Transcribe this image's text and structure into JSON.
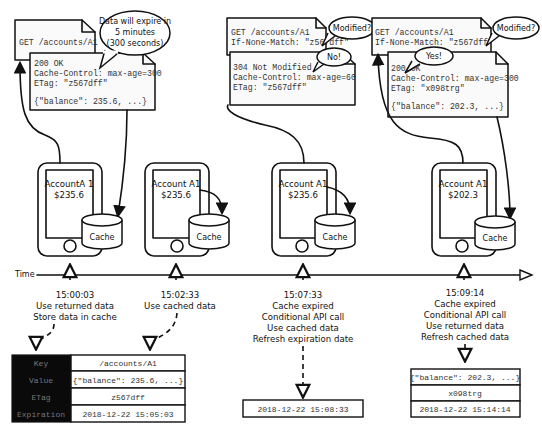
{
  "timeline": {
    "label": "Time"
  },
  "requests": [
    {
      "id": "r1",
      "request_lines": [
        "GET /accounts/A1"
      ],
      "response_lines": [
        "200 OK",
        "Cache-Control: max-age=300",
        "ETag: \"z567dff\"",
        "",
        "{\"balance\": 235.6, ...}"
      ],
      "bubble": [
        "Data will expire in",
        "5 minutes",
        "(300 seconds)"
      ]
    },
    {
      "id": "r2",
      "request_lines": [
        "GET /accounts/A1",
        "If-None-Match: \"z567dff\""
      ],
      "request_bubble": "Modified?",
      "response_lines": [
        "304 Not Modified",
        "Cache-Control: max-age=60",
        "ETag: \"z567dff\""
      ],
      "response_bubble": "No!"
    },
    {
      "id": "r3",
      "request_lines": [
        "GET /accounts/A1",
        "If-None-Match: \"z567dff\""
      ],
      "request_bubble": "Modified?",
      "response_lines": [
        "200 OK",
        "Cache-Control: max-age=300",
        "ETag: \"x098trg\"",
        "",
        "{\"balance\": 202.3, ...}"
      ],
      "response_bubble": "Yes!"
    }
  ],
  "phones": [
    {
      "account": "AccountA 1",
      "balance": "$235.6",
      "cache_label": "Cache"
    },
    {
      "account": "Account A1",
      "balance": "$235.6",
      "cache_label": "Cache"
    },
    {
      "account": "Account A1",
      "balance": "$235.6",
      "cache_label": "Cache"
    },
    {
      "account": "Account A1",
      "balance": "$202.3",
      "cache_label": "Cache"
    }
  ],
  "events": [
    {
      "time": "15:00:03",
      "lines": [
        "Use returned data",
        "Store data in cache"
      ]
    },
    {
      "time": "15:02:33",
      "lines": [
        "Use cached data"
      ]
    },
    {
      "time": "15:07:33",
      "lines": [
        "Cache expired",
        "Conditional API call",
        "Use cached data",
        "Refresh expiration date"
      ]
    },
    {
      "time": "15:09:14",
      "lines": [
        "Cache expired",
        "Conditional API call",
        "Use returned data",
        "Refresh cached data"
      ]
    }
  ],
  "cache_table": {
    "rows": [
      {
        "key": "Key",
        "value": "/accounts/A1"
      },
      {
        "key": "Value",
        "value": "{\"balance\": 235.6, ...}"
      },
      {
        "key": "ETag",
        "value": "z567dff"
      },
      {
        "key": "Expiration",
        "value": "2018-12-22 15:05:03"
      }
    ]
  },
  "cache_update_1": {
    "expiration": "2018-12-22 15:08:33"
  },
  "cache_update_2": {
    "value": "{\"balance\": 202.3, ...}",
    "etag": "x098trg",
    "expiration": "2018-12-22 15:14:14"
  }
}
